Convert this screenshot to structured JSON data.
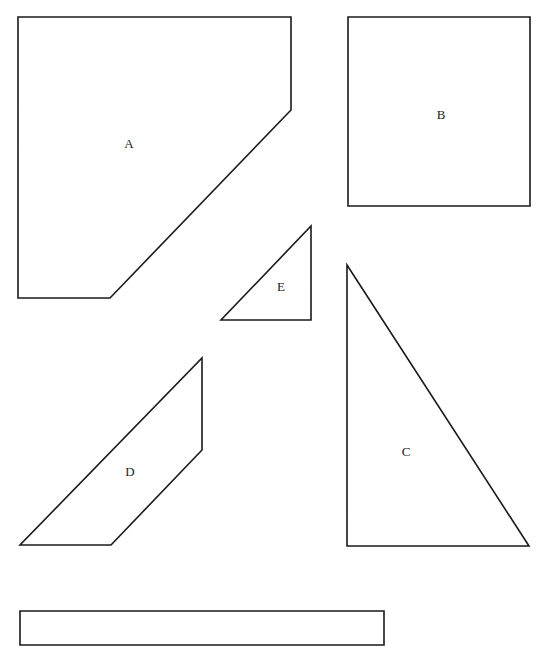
{
  "diagram": {
    "stroke_color": "#1a1a1a",
    "background": "#ffffff",
    "shapes": [
      {
        "id": "A",
        "label": "A",
        "kind": "pentagon",
        "points": "18,17 291,17 291,110 110,298 18,298",
        "label_x": 129,
        "label_y": 148
      },
      {
        "id": "B",
        "label": "B",
        "kind": "rectangle",
        "points": "348,17 530,17 530,206 348,206",
        "label_x": 441,
        "label_y": 119
      },
      {
        "id": "E",
        "label": "E",
        "kind": "right-triangle",
        "points": "311,226 311,320 221,320",
        "label_x": 281,
        "label_y": 291
      },
      {
        "id": "D",
        "label": "D",
        "kind": "parallelogram",
        "points": "202,358 202,450 111,545 20,545",
        "label_x": 130,
        "label_y": 476
      },
      {
        "id": "C",
        "label": "C",
        "kind": "right-triangle",
        "points": "347,265 529,546 347,546",
        "label_x": 406,
        "label_y": 456
      },
      {
        "id": "strip",
        "label": "",
        "kind": "rectangle",
        "points": "20,611 384,611 384,645 20,645",
        "label_x": 0,
        "label_y": 0
      }
    ]
  }
}
